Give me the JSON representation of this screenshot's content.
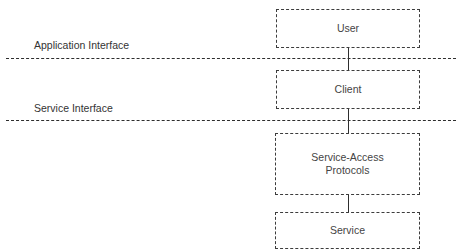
{
  "diagram": {
    "interfaces": [
      {
        "label": "Application Interface"
      },
      {
        "label": "Service Interface"
      }
    ],
    "boxes": [
      {
        "id": "user",
        "lines": [
          "User"
        ]
      },
      {
        "id": "client",
        "lines": [
          "Client"
        ]
      },
      {
        "id": "service-access-protocols",
        "lines": [
          "Service-Access",
          "Protocols"
        ]
      },
      {
        "id": "service",
        "lines": [
          "Service"
        ]
      }
    ],
    "connections": [
      {
        "from": "user",
        "to": "client"
      },
      {
        "from": "client",
        "to": "service-access-protocols"
      },
      {
        "from": "service-access-protocols",
        "to": "service"
      }
    ]
  }
}
